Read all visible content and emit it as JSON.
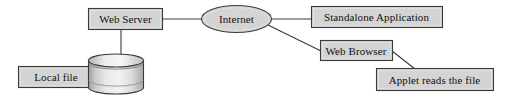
{
  "diagram": {
    "background_color": "#ffffff",
    "node_fill_color": "#d4d4d4",
    "node_border_color": "#3a3a3a",
    "line_color": "#3a3a3a",
    "nodes": [
      {
        "id": "web-server",
        "label": "Web Server",
        "shape": "rect"
      },
      {
        "id": "internet",
        "label": "Internet",
        "shape": "ellipse"
      },
      {
        "id": "standalone",
        "label": "Standalone Application",
        "shape": "rect"
      },
      {
        "id": "web-browser",
        "label": "Web Browser",
        "shape": "rect"
      },
      {
        "id": "applet",
        "label": "Applet reads the file",
        "shape": "rect"
      },
      {
        "id": "local-file",
        "label": "Local file",
        "shape": "rect"
      },
      {
        "id": "database",
        "label": "",
        "shape": "cylinder"
      }
    ],
    "edges": [
      {
        "from": "web-server",
        "to": "internet",
        "style": "straight"
      },
      {
        "from": "web-server",
        "to": "database",
        "style": "straight"
      },
      {
        "from": "local-file",
        "to": "database",
        "style": "straight"
      },
      {
        "from": "internet",
        "to": "standalone",
        "style": "straight"
      },
      {
        "from": "internet",
        "to": "web-browser",
        "style": "diagonal"
      },
      {
        "from": "web-browser",
        "to": "applet",
        "style": "diagonal"
      }
    ]
  }
}
